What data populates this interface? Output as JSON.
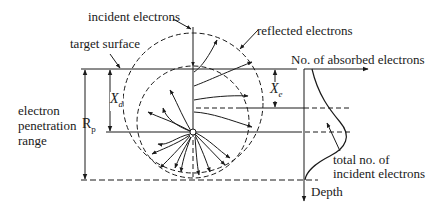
{
  "diagram": {
    "labels": {
      "incident_electrons": "incident electrons",
      "reflected_electrons": "reflected electrons",
      "target_surface": "target surface",
      "no_absorbed": "No. of absorbed electrons",
      "electron_line1": "electron",
      "electron_line2": "penetration",
      "electron_line3": "range",
      "rp_main": "R",
      "rp_sub": "p",
      "xd_main": "X",
      "xd_sub": "d",
      "xe_main": "X",
      "xe_sub": "e",
      "total_line1": "total no. of",
      "total_line2": "incident electrons",
      "depth": "Depth"
    },
    "colors": {
      "ink": "#1a1a1a",
      "background": "#ffffff"
    }
  }
}
